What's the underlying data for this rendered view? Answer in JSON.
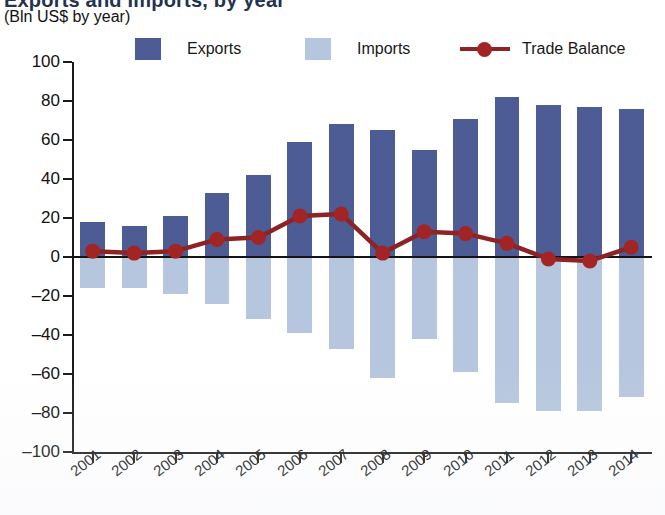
{
  "chart_data": {
    "type": "bar",
    "title": "Exports and Imports, by year",
    "subtitle": "(Bln US$ by year)",
    "xlabel": "",
    "ylabel": "",
    "ylim": [
      -100,
      100
    ],
    "ytick_step": 20,
    "yticks": [
      100,
      80,
      60,
      40,
      20,
      0,
      -20,
      -40,
      -60,
      -80,
      -100
    ],
    "ytick_labels": [
      "100",
      "80",
      "60",
      "40",
      "20",
      "0",
      "-20",
      "-40",
      "-60",
      "-80",
      "-100"
    ],
    "grid": false,
    "legend_position": "top",
    "categories": [
      "2001",
      "2002",
      "2003",
      "2004",
      "2005",
      "2006",
      "2007",
      "2008",
      "2009",
      "2010",
      "2011",
      "2012",
      "2013",
      "2014"
    ],
    "series": [
      {
        "name": "Exports",
        "type": "bar",
        "color": "#4d5c94",
        "values": [
          18,
          16,
          21,
          33,
          42,
          59,
          68,
          65,
          55,
          71,
          82,
          78,
          77,
          76
        ]
      },
      {
        "name": "Imports",
        "type": "bar",
        "color": "#b5c6de",
        "values": [
          -16,
          -16,
          -19,
          -24,
          -32,
          -39,
          -47,
          -62,
          -42,
          -59,
          -75,
          -79,
          -79,
          -72
        ]
      },
      {
        "name": "Trade Balance",
        "type": "line",
        "color": "#8e2323",
        "marker_color": "#a32424",
        "values": [
          3,
          2,
          3,
          9,
          10,
          21,
          22,
          2,
          13,
          12,
          7,
          -1,
          -2,
          5
        ]
      }
    ]
  },
  "legend": {
    "items": [
      {
        "label": "Exports",
        "marker": "square-swatch",
        "color": "#4d5c94"
      },
      {
        "label": "Imports",
        "marker": "square-swatch",
        "color": "#b5c6de"
      },
      {
        "label": "Trade Balance",
        "marker": "line-with-dot",
        "color": "#8e2323"
      }
    ]
  }
}
